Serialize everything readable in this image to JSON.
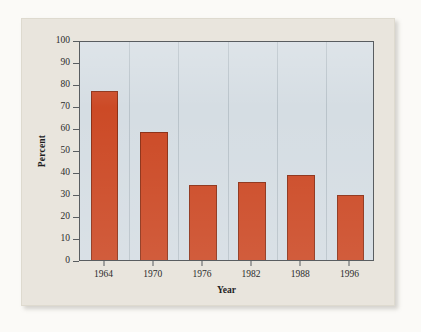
{
  "chart_data": {
    "type": "bar",
    "title": "",
    "subtitle": "",
    "xlabel": "Year",
    "ylabel": "Percent",
    "categories": [
      "1964",
      "1970",
      "1976",
      "1982",
      "1988",
      "1996"
    ],
    "values": [
      77,
      58,
      34,
      35.5,
      38.5,
      29.5
    ],
    "series": [
      {
        "name": "Percent",
        "values": [
          77,
          58,
          34,
          35.5,
          38.5,
          29.5
        ]
      }
    ],
    "ylim": [
      0,
      100
    ],
    "ytick_values": [
      0,
      10,
      20,
      30,
      40,
      50,
      60,
      70,
      80,
      90,
      100
    ],
    "ytick_labels": [
      "0",
      "10",
      "20",
      "30",
      "40",
      "50",
      "60",
      "70",
      "80",
      "90",
      "100"
    ],
    "xtick_labels": [
      "1964",
      "1970",
      "1976",
      "1982",
      "1988",
      "1996"
    ],
    "grid": "vertical-category-separators",
    "legend": "none",
    "annotations": []
  },
  "style": {
    "bar_color": "#cc4a26",
    "bar_edge_color": "#8c3016",
    "plot_background": "#d5dde3",
    "panel_background": "#e9e5dd",
    "page_background": "#fbfaf7",
    "axis_line_color": "#595d60",
    "gridline_color": "#b9c3ca",
    "text_color": "#2b2b2b"
  }
}
